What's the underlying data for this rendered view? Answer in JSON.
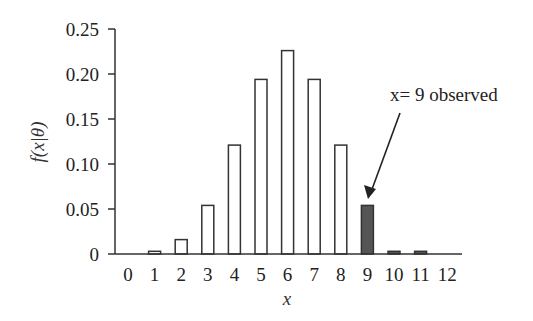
{
  "chart_data": {
    "type": "bar",
    "title": "",
    "xlabel": "x",
    "ylabel": "f(x|θ)",
    "categories": [
      "0",
      "1",
      "2",
      "3",
      "4",
      "5",
      "6",
      "7",
      "8",
      "9",
      "10",
      "11",
      "12"
    ],
    "values": [
      0.0002,
      0.003,
      0.016,
      0.054,
      0.121,
      0.194,
      0.226,
      0.194,
      0.121,
      0.054,
      0.003,
      0.003,
      0.0002
    ],
    "highlighted": [
      "9",
      "10",
      "11"
    ],
    "bar_colors": {
      "default": "#ffffff",
      "highlight": "#555555",
      "edge": "#333333"
    },
    "ylim": [
      0,
      0.25
    ],
    "yticks": [
      "0",
      "0.05",
      "0.10",
      "0.15",
      "0.20",
      "0.25"
    ],
    "grid": false,
    "legend": null,
    "annotations": [
      {
        "text": "x= 9 observed",
        "target": "9",
        "arrow": true
      }
    ]
  }
}
